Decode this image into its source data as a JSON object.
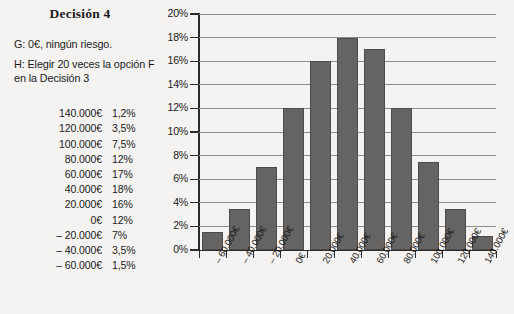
{
  "panel": {
    "title": "Decisión 4",
    "option_g": "G: 0€, ningún riesgo.",
    "option_h": "H: Elegir 20 veces la opción F en la Decisión 3",
    "table": {
      "rows": [
        {
          "amount": "140.000€",
          "percent": "1,2%"
        },
        {
          "amount": "120.000€",
          "percent": "3,5%"
        },
        {
          "amount": "100.000€",
          "percent": "7,5%"
        },
        {
          "amount": "80.000€",
          "percent": "12%"
        },
        {
          "amount": "60.000€",
          "percent": "17%"
        },
        {
          "amount": "40.000€",
          "percent": "18%"
        },
        {
          "amount": "20.000€",
          "percent": "16%"
        },
        {
          "amount": "0€",
          "percent": "12%"
        },
        {
          "amount": "– 20.000€",
          "percent": "7%"
        },
        {
          "amount": "– 40.000€",
          "percent": "3,5%"
        },
        {
          "amount": "– 60.000€",
          "percent": "1,5%"
        }
      ]
    }
  },
  "chart_data": {
    "type": "bar",
    "title": "",
    "xlabel": "",
    "ylabel": "",
    "categories": [
      "– 60.000€",
      "– 40.000€",
      "– 20.000€",
      "0€",
      "20.000€",
      "40.000€",
      "60.000€",
      "80.000€",
      "100.000€",
      "120.000€",
      "140.000€"
    ],
    "values": [
      1.5,
      3.5,
      7,
      12,
      16,
      18,
      17,
      12,
      7.5,
      3.5,
      1.2
    ],
    "ylim": [
      0,
      20
    ],
    "ytick_step": 2,
    "ytick_labels": [
      "0%",
      "2%",
      "4%",
      "6%",
      "8%",
      "10%",
      "12%",
      "14%",
      "16%",
      "18%",
      "20%"
    ],
    "grid": true,
    "legend": "none",
    "bar_color": "#666463",
    "gridline_color": "#8d8d8d",
    "axis_color": "#2b2b2b"
  }
}
